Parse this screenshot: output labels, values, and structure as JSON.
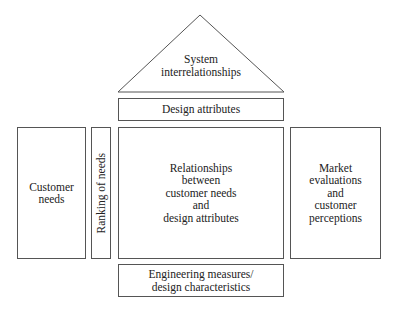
{
  "diagram": {
    "type": "house-of-quality",
    "roof": {
      "label": "System\ninterrelationships"
    },
    "design_attributes": {
      "label": "Design attributes"
    },
    "customer_needs": {
      "label": "Customer\nneeds"
    },
    "ranking": {
      "label": "Ranking of needs"
    },
    "center": {
      "label": "Relationships\nbetween\ncustomer needs\nand\ndesign attributes"
    },
    "market": {
      "label": "Market\nevaluations\nand\ncustomer\nperceptions"
    },
    "engineering": {
      "label": "Engineering measures/\ndesign characteristics"
    }
  }
}
